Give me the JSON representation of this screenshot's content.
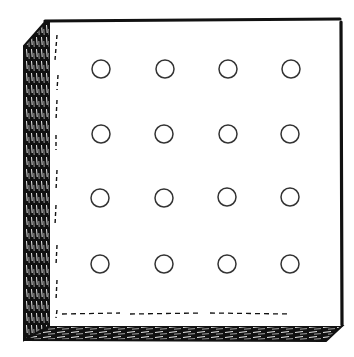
{
  "figure": {
    "grid": {
      "rows": 4,
      "cols": 4,
      "count": 16
    },
    "hole_centers_x": [
      101,
      165,
      228,
      291
    ],
    "hole_centers_y": [
      69,
      134,
      197,
      264
    ],
    "hole_radius": 9,
    "colors": {
      "ink": "#111111",
      "paper": "#ffffff",
      "hole_stroke": "#333333"
    }
  }
}
